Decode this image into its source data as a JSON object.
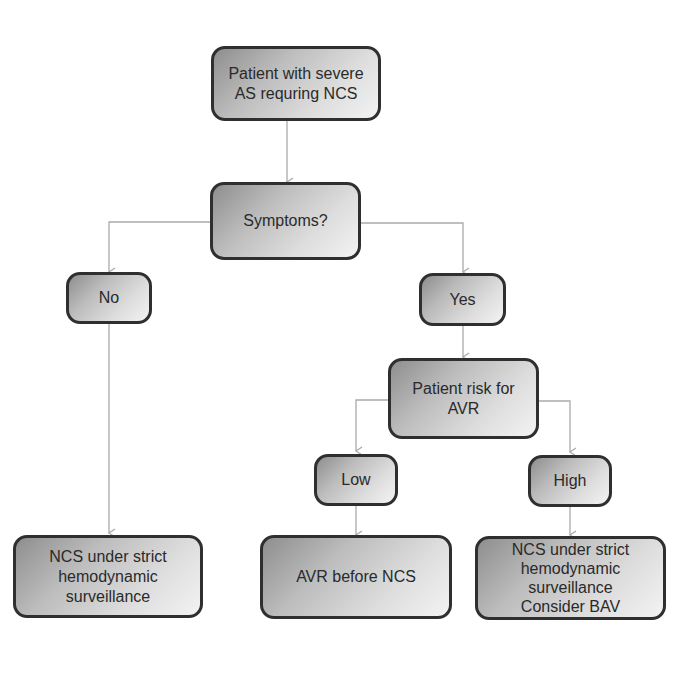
{
  "colors": {
    "box_border": "#2f2f2f",
    "connector": "#aaaaaa",
    "text": "#2a2a2a"
  },
  "nodes": {
    "start": "Patient with severe\nAS requring NCS",
    "symptoms": "Symptoms?",
    "no": "No",
    "yes": "Yes",
    "risk": "Patient risk for\nAVR",
    "low": "Low",
    "high": "High",
    "outcome_no": "NCS under strict\nhemodynamic\nsurveillance",
    "outcome_low": "AVR before NCS",
    "outcome_high": "NCS under strict\nhemodynamic\nsurveillance\nConsider BAV"
  }
}
